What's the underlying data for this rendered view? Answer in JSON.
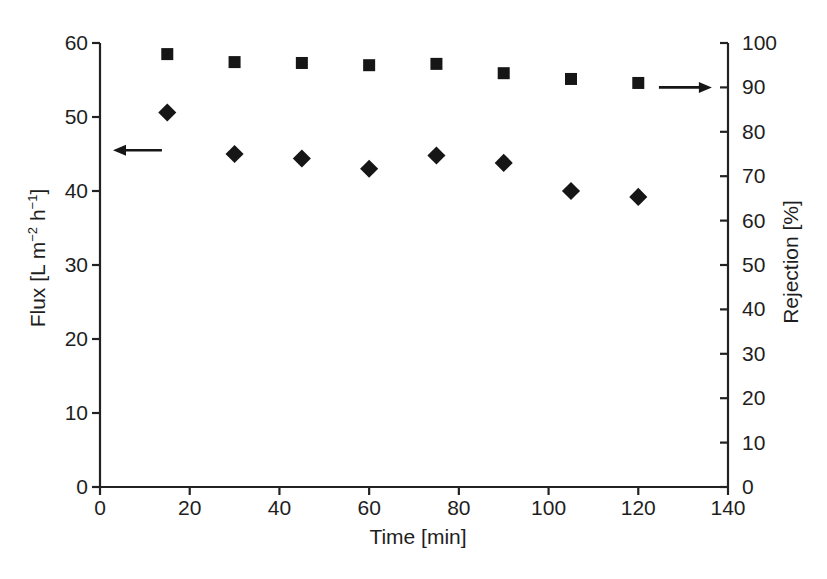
{
  "chart_data": {
    "type": "scatter",
    "title": "",
    "x": [
      15,
      30,
      45,
      60,
      75,
      90,
      105,
      120
    ],
    "series": [
      {
        "name": "Flux",
        "axis": "left",
        "marker": "filled-diamond",
        "color": "#161616",
        "values": [
          50.6,
          45.0,
          44.4,
          43.0,
          44.8,
          43.8,
          40.0,
          39.2
        ]
      },
      {
        "name": "Rejection",
        "axis": "right",
        "marker": "filled-square",
        "color": "#161616",
        "values": [
          97.5,
          95.7,
          95.5,
          95.0,
          95.3,
          93.2,
          91.9,
          91.0
        ]
      }
    ],
    "axes": {
      "x": {
        "label": "Time [min]",
        "min": 0,
        "max": 140,
        "tick_step": 20
      },
      "y_left": {
        "label": "Flux [L m−2 h−1]",
        "label_parts": {
          "prefix": "Flux [L m",
          "sup1": "−2",
          "mid": " h",
          "sup2": "−1",
          "suffix": "]"
        },
        "min": 0,
        "max": 60,
        "tick_step": 10
      },
      "y_right": {
        "label": "Rejection [%]",
        "min": 0,
        "max": 100,
        "tick_step": 10
      }
    },
    "grid": false,
    "legend": "none",
    "annotations": [
      {
        "name": "flux-axis-pointer",
        "direction": "left",
        "axis": "left",
        "y_value": 45.5,
        "x_from": 13.8,
        "x_to": 2.9
      },
      {
        "name": "rejection-axis-pointer",
        "direction": "right",
        "axis": "right",
        "y_value": 90,
        "x_from": 124.6,
        "x_to": 136.4
      }
    ]
  },
  "colors": {
    "background": "#ffffff",
    "ink": "#1e1e1e",
    "marker": "#161616",
    "axis": "#222222"
  }
}
